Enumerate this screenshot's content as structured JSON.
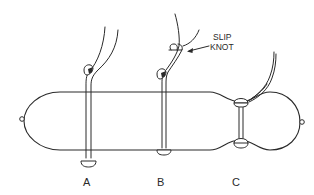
{
  "figure": {
    "labels": {
      "a": "A",
      "b": "B",
      "c": "C"
    },
    "annotation": {
      "line1": "SLIP",
      "line2": "KNOT"
    },
    "colors": {
      "stroke": "#2a2a2a",
      "background": "#ffffff"
    }
  }
}
